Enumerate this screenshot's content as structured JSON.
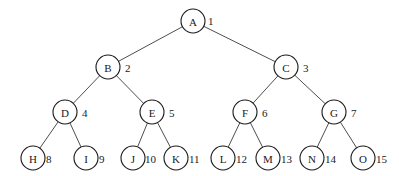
{
  "diagram": {
    "type": "complete-binary-tree",
    "node_radius": 12,
    "colors": {
      "background": "#ffffff",
      "stroke": "#1a1a1a",
      "edge": "#3a3a3a",
      "text": "#1a1a1a"
    },
    "nodes": [
      {
        "id": "A",
        "label": "A",
        "index": "1",
        "x": 193,
        "y": 21,
        "ix": 208,
        "iy": 21
      },
      {
        "id": "B",
        "label": "B",
        "index": "2",
        "x": 108,
        "y": 67,
        "ix": 125,
        "iy": 68
      },
      {
        "id": "C",
        "label": "C",
        "index": "3",
        "x": 286,
        "y": 67,
        "ix": 303,
        "iy": 68
      },
      {
        "id": "D",
        "label": "D",
        "index": "4",
        "x": 65,
        "y": 112,
        "ix": 82,
        "iy": 113
      },
      {
        "id": "E",
        "label": "E",
        "index": "5",
        "x": 152,
        "y": 112,
        "ix": 169,
        "iy": 113
      },
      {
        "id": "F",
        "label": "F",
        "index": "6",
        "x": 245,
        "y": 112,
        "ix": 262,
        "iy": 113
      },
      {
        "id": "G",
        "label": "G",
        "index": "7",
        "x": 334,
        "y": 112,
        "ix": 351,
        "iy": 113
      },
      {
        "id": "H",
        "label": "H",
        "index": "8",
        "x": 33,
        "y": 158,
        "ix": 46,
        "iy": 159
      },
      {
        "id": "I",
        "label": "I",
        "index": "9",
        "x": 86,
        "y": 158,
        "ix": 99,
        "iy": 159
      },
      {
        "id": "J",
        "label": "J",
        "index": "10",
        "x": 133,
        "y": 158,
        "ix": 145,
        "iy": 159
      },
      {
        "id": "K",
        "label": "K",
        "index": "11",
        "x": 176,
        "y": 158,
        "ix": 189,
        "iy": 159
      },
      {
        "id": "L",
        "label": "L",
        "index": "12",
        "x": 223,
        "y": 158,
        "ix": 236,
        "iy": 159
      },
      {
        "id": "M",
        "label": "M",
        "index": "13",
        "x": 268,
        "y": 158,
        "ix": 281,
        "iy": 159
      },
      {
        "id": "N",
        "label": "N",
        "index": "14",
        "x": 312,
        "y": 158,
        "ix": 325,
        "iy": 159
      },
      {
        "id": "O",
        "label": "O",
        "index": "15",
        "x": 363,
        "y": 158,
        "ix": 376,
        "iy": 159
      }
    ],
    "edges": [
      {
        "from": "A",
        "to": "B"
      },
      {
        "from": "A",
        "to": "C"
      },
      {
        "from": "B",
        "to": "D"
      },
      {
        "from": "B",
        "to": "E"
      },
      {
        "from": "C",
        "to": "F"
      },
      {
        "from": "C",
        "to": "G"
      },
      {
        "from": "D",
        "to": "H"
      },
      {
        "from": "D",
        "to": "I"
      },
      {
        "from": "E",
        "to": "J"
      },
      {
        "from": "E",
        "to": "K"
      },
      {
        "from": "F",
        "to": "L"
      },
      {
        "from": "F",
        "to": "M"
      },
      {
        "from": "G",
        "to": "N"
      },
      {
        "from": "G",
        "to": "O"
      }
    ]
  }
}
